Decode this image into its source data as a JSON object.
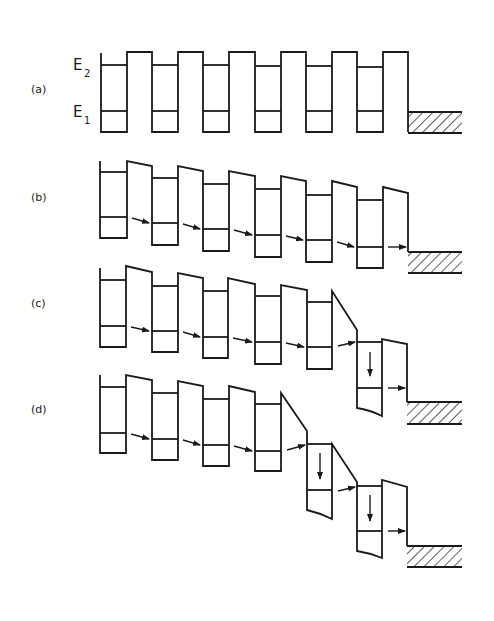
{
  "figure": {
    "panels": [
      {
        "id": "a",
        "label": "(a)",
        "description": "Zero bias: periodic superlattice wells with levels E1 and E2, contact at right"
      },
      {
        "id": "b",
        "label": "(b)",
        "description": "Low bias: uniform field, sequential tunneling E1 to E1 between wells"
      },
      {
        "id": "c",
        "label": "(c)",
        "description": "High-field domain forms at last well: E1 to E2 resonant tunneling then relaxation"
      },
      {
        "id": "d",
        "label": "(d)",
        "description": "High-field domain expands by one period"
      }
    ],
    "energy_labels": {
      "e2_main": "E",
      "e2_sub": "2",
      "e1_main": "E",
      "e1_sub": "1"
    },
    "colors": {
      "ink": "#1a1a1a",
      "background": "#ffffff"
    }
  }
}
